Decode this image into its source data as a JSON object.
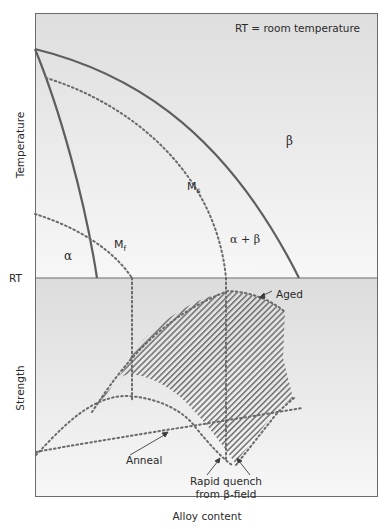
{
  "diagram": {
    "type": "phase-diagram-with-strength-plot",
    "note": "RT = room temperature",
    "axes": {
      "top_ylabel": "Temperature",
      "bottom_ylabel": "Strength",
      "xlabel": "Alloy content",
      "rt_tick": "RT"
    },
    "regions": {
      "alpha": "α",
      "beta": "β",
      "alpha_beta": "α + β"
    },
    "curves": {
      "ms_main": "M",
      "ms_sub": "s",
      "mf_main": "M",
      "mf_sub": "f"
    },
    "annotations": {
      "aged": "Aged",
      "anneal": "Anneal",
      "quench_line1": "Rapid quench",
      "quench_line2": "from β-field"
    },
    "colors": {
      "line": "#5e5e5e",
      "dotted": "#6a6a6a",
      "panel_top": "#e2e2e2",
      "panel_bottom": "#f6f6f6",
      "frame": "#6b6b6b",
      "hatch": "#6f6f6f"
    }
  }
}
